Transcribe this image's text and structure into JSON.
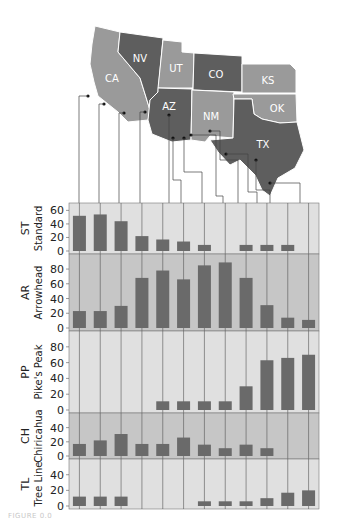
{
  "map": {
    "states": [
      {
        "code": "CA",
        "fill": "#9a9a9a"
      },
      {
        "code": "NV",
        "fill": "#5e5e5e"
      },
      {
        "code": "UT",
        "fill": "#9a9a9a"
      },
      {
        "code": "CO",
        "fill": "#5e5e5e"
      },
      {
        "code": "KS",
        "fill": "#9a9a9a"
      },
      {
        "code": "AZ",
        "fill": "#5e5e5e"
      },
      {
        "code": "NM",
        "fill": "#9a9a9a"
      },
      {
        "code": "OK",
        "fill": "#9a9a9a"
      },
      {
        "code": "TX",
        "fill": "#5e5e5e"
      }
    ]
  },
  "chart_data": {
    "type": "bar",
    "title": "",
    "xlabel": "",
    "categories": [
      "1",
      "2",
      "3",
      "4",
      "5",
      "6",
      "7",
      "8",
      "9",
      "10",
      "11",
      "12"
    ],
    "panels": [
      {
        "code": "ST",
        "name": "Standard",
        "ticks": [
          0,
          20,
          40,
          60
        ],
        "ylim": [
          0,
          65
        ],
        "bg": "#e0e0e0",
        "values": [
          52,
          54,
          44,
          22,
          17,
          14,
          9,
          0,
          9,
          9,
          9,
          0
        ]
      },
      {
        "code": "AR",
        "name": "Arrowhead",
        "ticks": [
          0,
          20,
          40,
          60,
          80
        ],
        "ylim": [
          0,
          95
        ],
        "bg": "#c6c6c6",
        "values": [
          23,
          23,
          30,
          68,
          78,
          66,
          85,
          89,
          68,
          31,
          14,
          11
        ]
      },
      {
        "code": "PP",
        "name": "Pike's Peak",
        "ticks": [
          0,
          20,
          40,
          60,
          80
        ],
        "ylim": [
          0,
          95
        ],
        "bg": "#e0e0e0",
        "values": [
          0,
          0,
          0,
          0,
          11,
          11,
          11,
          11,
          30,
          63,
          66,
          70
        ]
      },
      {
        "code": "CH",
        "name": "Chiricahua",
        "ticks": [
          0,
          20,
          40
        ],
        "ylim": [
          0,
          55
        ],
        "bg": "#c6c6c6",
        "values": [
          17,
          22,
          31,
          17,
          17,
          26,
          16,
          11,
          16,
          11,
          0,
          0
        ]
      },
      {
        "code": "TL",
        "name": "Tree Line",
        "ticks": [
          0,
          20,
          40
        ],
        "ylim": [
          0,
          55
        ],
        "bg": "#e0e0e0",
        "values": [
          12,
          12,
          12,
          0,
          0,
          0,
          6,
          6,
          6,
          10,
          17,
          20
        ]
      }
    ],
    "bar_color": "#6a6a6a",
    "grid": false,
    "legend": "none"
  },
  "caption": "FIGURE 0.0"
}
